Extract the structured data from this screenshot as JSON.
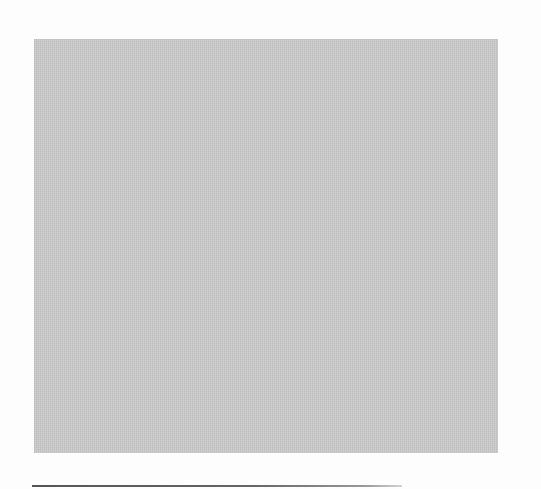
{
  "figure": {
    "panel_color": "#c9c9c9",
    "rule_color": "#555555"
  }
}
